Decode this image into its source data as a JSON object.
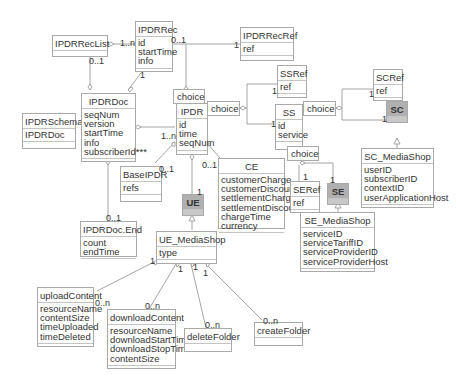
{
  "diagram": {
    "type": "UML class diagram",
    "classes": {
      "ipdrreclist": {
        "name": "IPDRRecList",
        "attributes": []
      },
      "ipdrrec": {
        "name": "IPDRRec",
        "attributes": [
          "id",
          "startTime",
          "info"
        ]
      },
      "ipdrrecref": {
        "name": "IPDRRecRef",
        "attributes": [
          "ref"
        ]
      },
      "ipdrschema": {
        "name": "IPDRSchema",
        "attributes": [
          "IPDRDoc"
        ]
      },
      "ipdrdoc": {
        "name": "IPDRDoc",
        "attributes": [
          "seqNum",
          "version",
          "startTime",
          "info",
          "subscriberId***"
        ]
      },
      "ipdr": {
        "name": "IPDR",
        "attributes": [
          "id",
          "time",
          "seqNum"
        ]
      },
      "ssref": {
        "name": "SSRef",
        "attributes": [
          "ref"
        ]
      },
      "ss": {
        "name": "SS",
        "attributes": [
          "id",
          "service"
        ]
      },
      "scref": {
        "name": "SCRef",
        "attributes": [
          "ref"
        ]
      },
      "sc": {
        "name": "SC",
        "attributes": []
      },
      "sc_mediashop": {
        "name": "SC_MediaShop",
        "attributes": [
          "userID",
          "subscriberID",
          "contextID",
          "userApplicationHost"
        ]
      },
      "baseipdr": {
        "name": "BaseIPDR",
        "attributes": [
          "refs"
        ]
      },
      "ce": {
        "name": "CE",
        "attributes": [
          "customerCharge",
          "customerDiscount",
          "settlementCharge",
          "settlementDiscount",
          "chargeTime",
          "currency"
        ]
      },
      "ue": {
        "name": "UE",
        "attributes": []
      },
      "seref": {
        "name": "SERef",
        "attributes": [
          "ref"
        ]
      },
      "se": {
        "name": "SE",
        "attributes": []
      },
      "ipdrdocend": {
        "name": "IPDRDoc.End",
        "attributes": [
          "count",
          "endTime"
        ]
      },
      "ue_mediashop": {
        "name": "UE_MediaShop",
        "attributes": [
          "type"
        ]
      },
      "se_mediashop": {
        "name": "SE_MediaShop",
        "attributes": [
          "serviceID",
          "serviceTariffID",
          "serviceProviderID",
          "serviceProviderHost"
        ]
      },
      "uploadcontent": {
        "name": "uploadContent",
        "attributes": [
          "resourceName",
          "contentSize",
          "timeUploaded",
          "timeDeleted"
        ]
      },
      "downloadcontent": {
        "name": "downloadContent",
        "attributes": [
          "resourceName",
          "downloadStartTime",
          "downloadStopTime",
          "contentSize"
        ]
      },
      "deletefolder": {
        "name": "deleteFolder",
        "attributes": []
      },
      "createfolder": {
        "name": "createFolder",
        "attributes": []
      }
    },
    "choices": {
      "c1": "choice",
      "c2": "choice",
      "c3": "choice",
      "c4": "choice"
    },
    "multiplicities": {
      "reclist_rec": "1..n",
      "reclist_doc": "0..1",
      "rec_ref": "0..1",
      "recref_1": "1",
      "rec_doc": "1",
      "doc_ipdr": "1..n",
      "ssref_1": "1",
      "ss_1": "1",
      "scref_1": "1",
      "sc_1": "1",
      "base_01": "0..1",
      "ce_01": "0..1",
      "ue_1": "1",
      "docend_01": "0..1",
      "seref_1": "1",
      "se_1": "1",
      "uems_up_1": "1",
      "uems_dl_1": "1",
      "uems_del_1": "1",
      "uems_cr_1": "1",
      "up_0n": "0..n",
      "dl_0n": "0..n",
      "del_0n": "0..n",
      "cr_0n": "0..n"
    }
  }
}
